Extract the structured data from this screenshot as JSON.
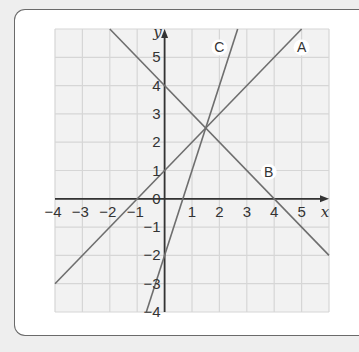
{
  "chart_data": {
    "type": "line",
    "title": "",
    "xlabel": "x",
    "ylabel": "y",
    "xlim": [
      -4,
      6
    ],
    "ylim": [
      -4,
      6
    ],
    "grid": true,
    "x_ticks": [
      -4,
      -3,
      -2,
      -1,
      0,
      1,
      2,
      3,
      4,
      5
    ],
    "y_ticks": [
      -4,
      -3,
      -2,
      -1,
      0,
      1,
      2,
      3,
      4,
      5
    ],
    "x_tick_labels": [
      "−4",
      "−3",
      "−2",
      "−1",
      "0",
      "1",
      "2",
      "3",
      "4",
      "5"
    ],
    "y_tick_labels": [
      "−4",
      "−3",
      "−2",
      "−1",
      "0",
      "1",
      "2",
      "3",
      "4",
      "5"
    ],
    "series": [
      {
        "name": "A",
        "equation": "y = x + 1",
        "x": [
          -4,
          5
        ],
        "y": [
          -3,
          6
        ],
        "label_at": [
          5,
          5.35
        ]
      },
      {
        "name": "B",
        "equation": "y = 4 − x",
        "x": [
          -2,
          6
        ],
        "y": [
          6,
          -2
        ],
        "label_at": [
          3.8,
          0.95
        ]
      },
      {
        "name": "C",
        "equation": "y = 3x − 2",
        "x": [
          -0.667,
          2.667
        ],
        "y": [
          -4,
          6
        ],
        "label_at": [
          2,
          5.35
        ]
      }
    ],
    "intersection_note": "All three lines meet near (1.5, 2.5)"
  },
  "colors": {
    "grid_bg": "#f2f2f2",
    "grid_line": "#d6d6d6",
    "axis": "#333333",
    "series_line": "#6e6e6e"
  }
}
